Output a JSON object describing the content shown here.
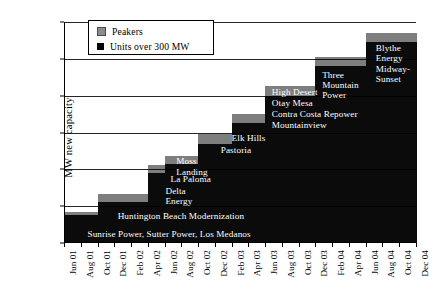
{
  "chart_data": {
    "type": "area",
    "title": "",
    "xlabel": "",
    "ylabel": "MW new capacity",
    "ylim": [
      0,
      12000
    ],
    "ytick_labels": [
      "0",
      "2,000",
      "4,000",
      "6,000",
      "8,000",
      "10,000",
      "12,000"
    ],
    "ytick_values": [
      0,
      2000,
      4000,
      6000,
      8000,
      10000,
      12000
    ],
    "grid": "horizontal",
    "legend_position": "upper-left-inside",
    "categories": [
      "Jun 01",
      "Aug 01",
      "Oct 01",
      "Dec 01",
      "Feb 02",
      "Apr 02",
      "Jun 02",
      "Aug 02",
      "Oct 02",
      "Dec 02",
      "Feb 03",
      "Apr 03",
      "Jun 03",
      "Aug 03",
      "Oct 03",
      "Dec 03",
      "Feb 04",
      "Apr 04",
      "Jun 04",
      "Aug 04",
      "Oct 04",
      "Dec 04"
    ],
    "series": [
      {
        "name": "Units over 300 MW",
        "color": "#0b0b0b",
        "values": [
          0,
          1500,
          1500,
          2250,
          2250,
          2250,
          3800,
          4300,
          4300,
          5400,
          5400,
          6500,
          6500,
          8000,
          8000,
          8000,
          9600,
          9600,
          9600,
          10900,
          10900,
          10900
        ]
      },
      {
        "name": "Peakers",
        "color": "#7e7e7e",
        "values": [
          0,
          200,
          200,
          400,
          400,
          400,
          450,
          450,
          450,
          500,
          500,
          500,
          500,
          500,
          500,
          500,
          500,
          500,
          500,
          500,
          500,
          500
        ]
      }
    ],
    "cumulative_total_end": 11400,
    "annotations": [
      {
        "text": "Sunrise Power, Sutter Power, Los Medanos",
        "x": "Aug 01",
        "y": 700,
        "color": "white"
      },
      {
        "text": "Huntington Beach Modernization",
        "x": "Dec 01",
        "y": 1700,
        "color": "white"
      },
      {
        "text": "Delta\nEnergy",
        "x": "Jun 02",
        "y": 2900,
        "color": "white"
      },
      {
        "text": "La Paloma",
        "x": "Jun 02",
        "y": 3500,
        "color": "white"
      },
      {
        "text": "Moss\nLanding",
        "x": "Jun 02",
        "y": 4400,
        "color": "white"
      },
      {
        "text": "Pastoria",
        "x": "Dec 02",
        "y": 5000,
        "color": "white"
      },
      {
        "text": "Elk Hills",
        "x": "Feb 03",
        "y": 5700,
        "color": "white"
      },
      {
        "text": "Mountainview",
        "x": "Aug 03",
        "y": 6500,
        "color": "white"
      },
      {
        "text": "Contra Costa Repower",
        "x": "Aug 03",
        "y": 7000,
        "color": "white"
      },
      {
        "text": "High Desert\nOtay Mesa",
        "x": "Aug 03",
        "y": 8100,
        "color": "white"
      },
      {
        "text": "Three\nMountain\nPower",
        "x": "Feb 04",
        "y": 9000,
        "color": "white"
      },
      {
        "text": "Blythe\nEnergy\nMidway-\nSunset",
        "x": "Aug 04",
        "y": 10400,
        "color": "white"
      }
    ]
  },
  "legend": {
    "items": [
      {
        "label": "Peakers",
        "color": "#8b8b8b"
      },
      {
        "label": "Units over 300 MW",
        "color": "#000000"
      }
    ]
  },
  "axes": {
    "y_title": "MW new capacity",
    "y_ticks": [
      "12,000",
      "10,000",
      "8,000",
      "6,000",
      "4,000",
      "2,000",
      "0"
    ],
    "x_ticks": [
      "Jun 01",
      "Aug 01",
      "Oct 01",
      "Dec 01",
      "Feb 02",
      "Apr 02",
      "Jun 02",
      "Aug 02",
      "Oct 02",
      "Dec 02",
      "Feb 03",
      "Apr 03",
      "Jun 03",
      "Aug 03",
      "Oct 03",
      "Dec 03",
      "Feb 04",
      "Apr 04",
      "Jun 04",
      "Aug 04",
      "Oct 04",
      "Dec 04"
    ]
  },
  "annotations": {
    "a0": "Sunrise Power, Sutter Power, Los Medanos",
    "a1": "Huntington Beach Modernization",
    "a2_l1": "Delta",
    "a2_l2": "Energy",
    "a3": "La Paloma",
    "a4_l1": "Moss",
    "a4_l2": "Landing",
    "a5": "Pastoria",
    "a6": "Elk Hills",
    "a7": "Mountainview",
    "a8": "Contra Costa Repower",
    "a9_l1": "High Desert",
    "a9_l2": "Otay Mesa",
    "a10_l1": "Three",
    "a10_l2": "Mountain",
    "a10_l3": "Power",
    "a11_l1": "Blythe",
    "a11_l2": "Energy",
    "a11_l3": "Midway-",
    "a11_l4": "Sunset"
  }
}
